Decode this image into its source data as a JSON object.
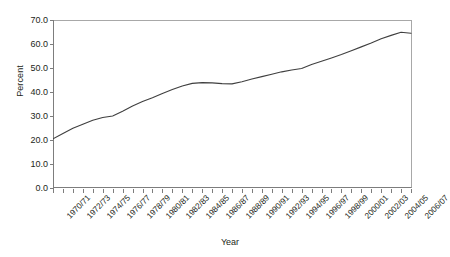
{
  "chart_data": {
    "type": "line",
    "title": "",
    "xlabel": "Year",
    "ylabel": "Percent",
    "ylim": [
      0.0,
      70.0
    ],
    "ytick_step": 10.0,
    "ytick_labels": [
      "0.0",
      "10.0",
      "20.0",
      "30.0",
      "40.0",
      "50.0",
      "60.0",
      "70.0"
    ],
    "grid": false,
    "legend": "none",
    "line_color": "#3f3f3f",
    "x_tick_interval_years": 1,
    "x_label_interval_years": 2,
    "categories": [
      "1970/71",
      "1971/72",
      "1972/73",
      "1973/74",
      "1974/75",
      "1975/76",
      "1976/77",
      "1977/78",
      "1978/79",
      "1979/80",
      "1980/81",
      "1981/82",
      "1982/83",
      "1983/84",
      "1984/85",
      "1985/86",
      "1986/87",
      "1987/88",
      "1988/89",
      "1989/90",
      "1990/91",
      "1991/92",
      "1992/93",
      "1993/94",
      "1994/95",
      "1995/96",
      "1996/97",
      "1997/98",
      "1998/99",
      "1999/2000",
      "2000/01",
      "2001/02",
      "2002/03",
      "2003/04",
      "2004/05",
      "2005/06",
      "2006/07"
    ],
    "tick_labels": [
      "1970/71",
      "1972/73",
      "1974/75",
      "1976/77",
      "1978/79",
      "1980/81",
      "1982/83",
      "1984/85",
      "1986/87",
      "1988/89",
      "1990/91",
      "1992/93",
      "1994/95",
      "1996/97",
      "1998/99",
      "2000/01",
      "2002/03",
      "2004/05",
      "2006/07"
    ],
    "values": [
      20.5,
      22.7,
      24.9,
      26.6,
      28.2,
      29.4,
      30.0,
      32.0,
      34.2,
      36.0,
      37.6,
      39.4,
      41.0,
      42.5,
      43.6,
      43.9,
      43.8,
      43.5,
      43.4,
      44.3,
      45.4,
      46.4,
      47.4,
      48.4,
      49.2,
      49.8,
      51.5,
      52.8,
      54.2,
      55.6,
      57.2,
      58.8,
      60.4,
      62.2,
      63.6,
      64.9,
      64.5
    ]
  }
}
